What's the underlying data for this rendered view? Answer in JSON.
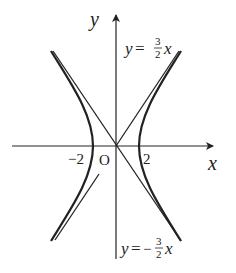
{
  "diagram": {
    "type": "hyperbola-with-asymptotes",
    "axes": {
      "x_label": "x",
      "y_label": "y",
      "origin_label": "O"
    },
    "ticks": {
      "left_vertex": "−2",
      "right_vertex": "2"
    },
    "asymptotes": [
      {
        "y": "y",
        "eq": "=",
        "num": "3",
        "den": "2",
        "var": "x",
        "sign": ""
      },
      {
        "y": "y",
        "eq": "=",
        "num": "3",
        "den": "2",
        "var": "x",
        "sign": "−"
      }
    ],
    "colors": {
      "stroke": "#222222",
      "background": "#ffffff"
    }
  }
}
